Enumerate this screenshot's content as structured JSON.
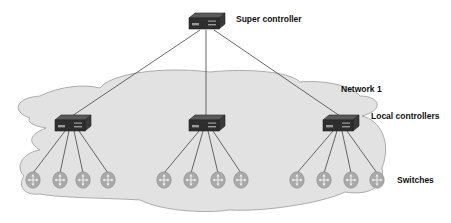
{
  "diagram": {
    "type": "hierarchical-sdn-controller-topology",
    "labels": {
      "super_controller": "Super controller",
      "network": "Network 1",
      "local_controllers": "Local controllers",
      "switches": "Switches"
    },
    "colors": {
      "cloud_fill": "#e2e2e2",
      "cloud_stroke": "#9a9a9a",
      "link": "#444444",
      "device_top": "#555555",
      "device_front": "#2e2e2e",
      "switch_fill": "#a9a9a9",
      "switch_arrow": "#e8e8e8"
    },
    "super_controller": {
      "icon": "controller-device-icon",
      "x": 206,
      "y": 22
    },
    "local_controllers": [
      {
        "icon": "controller-device-icon",
        "x": 72,
        "y": 124
      },
      {
        "icon": "controller-device-icon",
        "x": 206,
        "y": 124
      },
      {
        "icon": "controller-device-icon",
        "x": 340,
        "y": 124
      }
    ],
    "switch_groups": [
      {
        "controller": 0,
        "switches": [
          {
            "x": 33,
            "y": 180
          },
          {
            "x": 60,
            "y": 180
          },
          {
            "x": 83,
            "y": 180
          },
          {
            "x": 108,
            "y": 180
          }
        ]
      },
      {
        "controller": 1,
        "switches": [
          {
            "x": 164,
            "y": 180
          },
          {
            "x": 191,
            "y": 180
          },
          {
            "x": 218,
            "y": 180
          },
          {
            "x": 241,
            "y": 180
          }
        ]
      },
      {
        "controller": 2,
        "switches": [
          {
            "x": 297,
            "y": 180
          },
          {
            "x": 324,
            "y": 180
          },
          {
            "x": 351,
            "y": 180
          },
          {
            "x": 377,
            "y": 180
          }
        ]
      }
    ]
  }
}
